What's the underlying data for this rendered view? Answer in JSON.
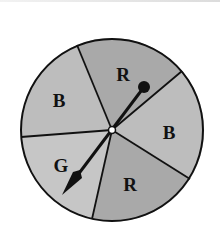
{
  "figure": {
    "type": "spinner"
  },
  "spinner": {
    "sectors": [
      {
        "label": "R",
        "fill": "#a9a9a9"
      },
      {
        "label": "B",
        "fill": "#bdbdbd"
      },
      {
        "label": "R",
        "fill": "#a9a9a9"
      },
      {
        "label": "G",
        "fill": "#c6c6c6"
      },
      {
        "label": "B",
        "fill": "#bdbdbd"
      }
    ],
    "pointer_points_to": "G",
    "outline_color": "#111111"
  }
}
